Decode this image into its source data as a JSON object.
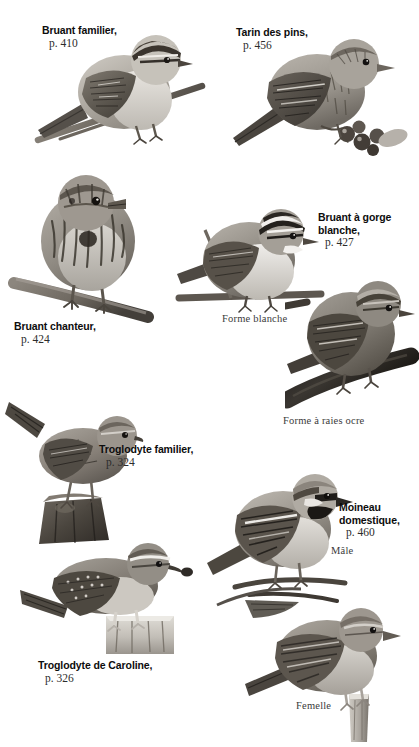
{
  "page": {
    "type": "field-guide-plate",
    "language": "fr",
    "background": "#ffffff",
    "width": 419,
    "height": 747
  },
  "species": [
    {
      "id": "bruant-familier",
      "name": "Bruant familier,",
      "page_ref": "p. 410",
      "common_en": "Chipping Sparrow",
      "label_pos": {
        "x": 42,
        "y": 24
      }
    },
    {
      "id": "tarin-des-pins",
      "name": "Tarin des pins,",
      "page_ref": "p. 456",
      "common_en": "Pine Siskin",
      "label_pos": {
        "x": 236,
        "y": 26
      }
    },
    {
      "id": "bruant-chanteur",
      "name": "Bruant chanteur,",
      "page_ref": "p. 424",
      "common_en": "Song Sparrow",
      "label_pos": {
        "x": 14,
        "y": 320
      }
    },
    {
      "id": "bruant-a-gorge-blanche",
      "name": "Bruant à gorge\nblanche,",
      "page_ref": "p. 427",
      "common_en": "White-throated Sparrow",
      "label_pos": {
        "x": 318,
        "y": 211
      }
    },
    {
      "id": "troglodyte-familier",
      "name": "Troglodyte familier,",
      "page_ref": "p. 324",
      "common_en": "House Wren",
      "label_pos": {
        "x": 99,
        "y": 443
      }
    },
    {
      "id": "moineau-domestique",
      "name": "Moineau\ndomestique,",
      "page_ref": "p. 460",
      "common_en": "House Sparrow",
      "label_pos": {
        "x": 339,
        "y": 501
      }
    },
    {
      "id": "troglodyte-de-caroline",
      "name": "Troglodyte de Caroline,",
      "page_ref": "p. 326",
      "common_en": "Carolina Wren",
      "label_pos": {
        "x": 38,
        "y": 659
      }
    }
  ],
  "captions": [
    {
      "id": "forme-blanche",
      "text": "Forme blanche",
      "x": 222,
      "y": 313
    },
    {
      "id": "forme-a-raies-ocre",
      "text": "Forme à raies ocre",
      "x": 283,
      "y": 415
    },
    {
      "id": "male",
      "text": "Mâle",
      "x": 331,
      "y": 545
    },
    {
      "id": "femelle",
      "text": "Femelle",
      "x": 296,
      "y": 700
    }
  ],
  "photos": [
    {
      "id": "photo-bruant-familier",
      "alt": "Chipping Sparrow perched on a diagonal twig"
    },
    {
      "id": "photo-tarin-des-pins",
      "alt": "Pine Siskin perched beside red berries"
    },
    {
      "id": "photo-bruant-chanteur",
      "alt": "Song Sparrow perched on an angled branch"
    },
    {
      "id": "photo-bruant-gorge-blanche-forme-blanche",
      "alt": "White-throated Sparrow white-striped form on a twig"
    },
    {
      "id": "photo-bruant-gorge-blanche-forme-raies-ocre",
      "alt": "White-throated Sparrow tan-striped form on a thick log"
    },
    {
      "id": "photo-troglodyte-familier",
      "alt": "House Wren with cocked tail on a mossy stump"
    },
    {
      "id": "photo-troglodyte-de-caroline",
      "alt": "Carolina Wren with insect in bill on a pale stump"
    },
    {
      "id": "photo-moineau-domestique-male",
      "alt": "Male House Sparrow with black bib on a branch"
    },
    {
      "id": "photo-moineau-domestique-femelle",
      "alt": "Female House Sparrow on a short post"
    }
  ]
}
